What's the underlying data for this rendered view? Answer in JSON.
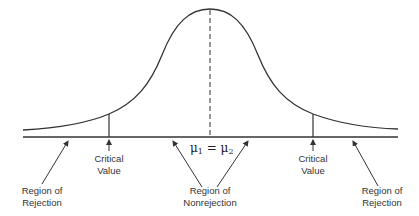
{
  "diagram": {
    "title": "",
    "curve": "normal distribution (two-tailed test)",
    "center_label": {
      "mu1": "μ",
      "sub1": "1",
      "equals": " = ",
      "mu2": "μ",
      "sub2": "2"
    },
    "labels": {
      "left_rejection": [
        "Region of",
        "Rejection"
      ],
      "left_critical": [
        "Critical",
        "Value"
      ],
      "nonrejection": [
        "Region of",
        "Nonrejection"
      ],
      "right_critical": [
        "Critical",
        "Value"
      ],
      "right_rejection": [
        "Region of",
        "Rejection"
      ]
    },
    "colors": {
      "line": "#333333",
      "text": "#333333",
      "background": "#ffffff"
    }
  }
}
